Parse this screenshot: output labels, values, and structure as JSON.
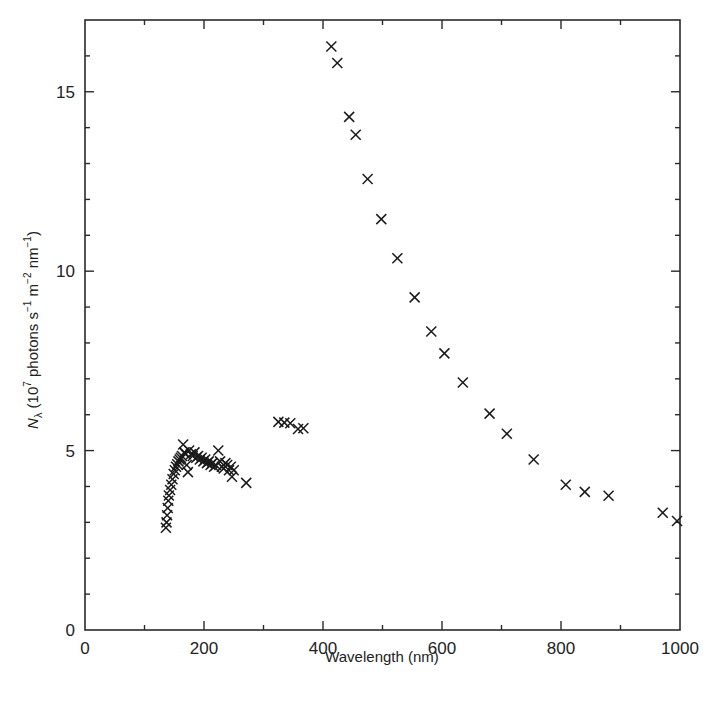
{
  "chart_data": {
    "type": "scatter",
    "title": "",
    "xlabel": "Wavelength (nm)",
    "ylabel": "N_λ (10^7 photons s^-1 m^-2 nm^-1)",
    "ylabel_parts": {
      "symbol": "N",
      "subscript": "λ",
      "unit_prefix": " (10",
      "exp1": "7",
      "unit_mid1": " photons s",
      "exp2": "−1",
      "unit_mid2": " m",
      "exp3": "−2",
      "unit_mid3": " nm",
      "exp4": "−1",
      "unit_suffix": ")"
    },
    "xlim": [
      0,
      1000
    ],
    "ylim": [
      0,
      17
    ],
    "x_major_ticks": [
      0,
      200,
      400,
      600,
      800,
      1000
    ],
    "x_minor_ticks": [
      100,
      300,
      500,
      700,
      900
    ],
    "y_major_ticks": [
      0,
      5,
      10,
      15
    ],
    "y_minor_ticks": [
      1,
      2,
      3,
      4,
      6,
      7,
      8,
      9,
      11,
      12,
      13,
      14,
      16
    ],
    "grid": false,
    "legend": null,
    "marker": "x",
    "series": [
      {
        "name": "N_lambda",
        "points": [
          [
            136,
            2.85
          ],
          [
            137,
            3.0
          ],
          [
            138,
            3.2
          ],
          [
            139,
            3.4
          ],
          [
            140,
            3.6
          ],
          [
            141,
            3.75
          ],
          [
            143,
            3.9
          ],
          [
            145,
            4.05
          ],
          [
            147,
            4.2
          ],
          [
            149,
            4.35
          ],
          [
            151,
            4.45
          ],
          [
            153,
            4.55
          ],
          [
            155,
            4.62
          ],
          [
            157,
            4.7
          ],
          [
            159,
            4.75
          ],
          [
            161,
            4.8
          ],
          [
            163,
            4.85
          ],
          [
            165,
            5.17
          ],
          [
            167,
            4.95
          ],
          [
            169,
            4.9
          ],
          [
            171,
            4.6
          ],
          [
            173,
            4.4
          ],
          [
            175,
            5.0
          ],
          [
            178,
            4.9
          ],
          [
            181,
            4.85
          ],
          [
            184,
            4.95
          ],
          [
            187,
            4.8
          ],
          [
            190,
            4.85
          ],
          [
            193,
            4.75
          ],
          [
            196,
            4.8
          ],
          [
            199,
            4.7
          ],
          [
            202,
            4.75
          ],
          [
            205,
            4.65
          ],
          [
            208,
            4.7
          ],
          [
            211,
            4.6
          ],
          [
            214,
            4.65
          ],
          [
            217,
            4.55
          ],
          [
            220,
            4.6
          ],
          [
            224,
            5.0
          ],
          [
            227,
            4.7
          ],
          [
            230,
            4.55
          ],
          [
            233,
            4.5
          ],
          [
            236,
            4.65
          ],
          [
            239,
            4.6
          ],
          [
            242,
            4.45
          ],
          [
            245,
            4.55
          ],
          [
            247,
            4.27
          ],
          [
            250,
            4.45
          ],
          [
            271,
            4.1
          ],
          [
            325,
            5.8
          ],
          [
            335,
            5.78
          ],
          [
            345,
            5.76
          ],
          [
            358,
            5.6
          ],
          [
            367,
            5.62
          ],
          [
            414,
            16.26
          ],
          [
            424,
            15.8
          ],
          [
            444,
            14.3
          ],
          [
            455,
            13.8
          ],
          [
            475,
            12.57
          ],
          [
            498,
            11.45
          ],
          [
            525,
            10.36
          ],
          [
            554,
            9.27
          ],
          [
            582,
            8.32
          ],
          [
            604,
            7.71
          ],
          [
            635,
            6.9
          ],
          [
            680,
            6.03
          ],
          [
            709,
            5.47
          ],
          [
            754,
            4.75
          ],
          [
            808,
            4.05
          ],
          [
            840,
            3.85
          ],
          [
            880,
            3.74
          ],
          [
            971,
            3.27
          ],
          [
            995,
            3.04
          ]
        ]
      }
    ]
  },
  "caption": ""
}
